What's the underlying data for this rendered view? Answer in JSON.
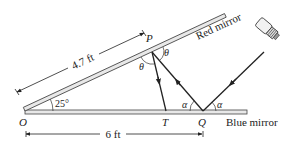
{
  "diagram": {
    "points": {
      "O": "O",
      "P": "P",
      "T": "T",
      "Q": "Q"
    },
    "angles": {
      "mirror_angle": "25°",
      "theta": "θ",
      "alpha": "α"
    },
    "dimensions": {
      "OP_length": "4.7 ft",
      "OQ_length": "6 ft"
    },
    "mirrors": {
      "top": "Red mirror",
      "bottom": "Blue mirror"
    },
    "light_source": "flashlight-icon",
    "colors": {
      "line": "#222222",
      "mirror_fill": "#e8e8e8",
      "background": "#ffffff"
    }
  }
}
